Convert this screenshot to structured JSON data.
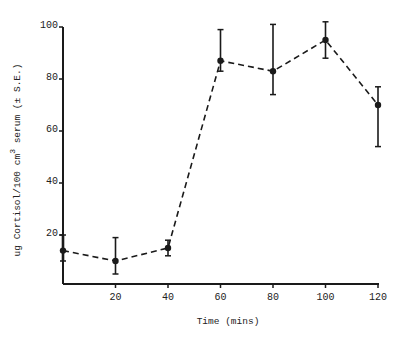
{
  "chart_data": {
    "type": "line",
    "title": "",
    "xlabel": "Time (mins)",
    "ylabel": "ug Cortisol/100 cm3 serum (± S.E.)",
    "ylabel_parts": {
      "main": "ug Cortisol/100 cm",
      "sup": "3",
      "rest": " serum (± S.E.)"
    },
    "x_ticks": [
      20,
      40,
      60,
      80,
      100,
      120
    ],
    "y_ticks": [
      20,
      40,
      60,
      80,
      100
    ],
    "xlim": [
      0,
      120
    ],
    "ylim": [
      0,
      100
    ],
    "grid": false,
    "legend": null,
    "line_style": "dashed",
    "marker": "filled-circle",
    "error_bars": true,
    "series": [
      {
        "name": "Cortisol",
        "x": [
          0,
          20,
          40,
          60,
          80,
          100,
          120
        ],
        "values": [
          14,
          10,
          15,
          87,
          83,
          95,
          70
        ],
        "err_low": [
          10,
          5,
          12,
          83,
          74,
          88,
          54
        ],
        "err_high": [
          20,
          19,
          18,
          99,
          101,
          102,
          77
        ]
      }
    ]
  },
  "labels": {
    "x_axis_title": "Time (mins)",
    "y_title_main": "ug Cortisol/100 cm",
    "y_title_sup": "3",
    "y_title_rest": " serum (± S.E.)"
  },
  "colors": {
    "ink": "#1a1a1a",
    "background": "#ffffff"
  }
}
